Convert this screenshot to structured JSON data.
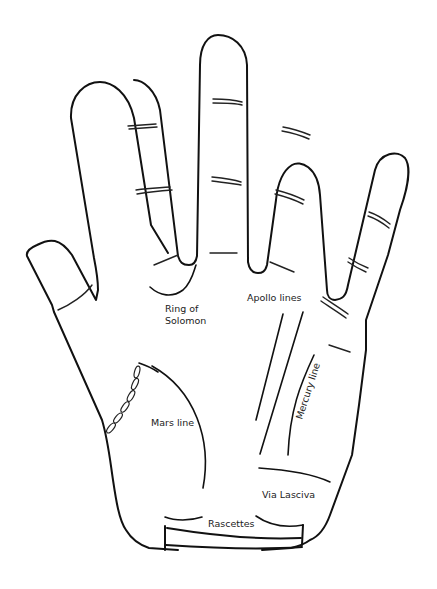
{
  "diagram": {
    "stroke_color": "#111111",
    "background_color": "#ffffff",
    "labels": {
      "ring_of_solomon_1": "Ring of",
      "ring_of_solomon_2": "Solomon",
      "apollo_lines": "Apollo lines",
      "mercury_line": "Mercury line",
      "mars_line": "Mars line",
      "via_lasciva": "Via Lasciva",
      "rascettes": "Rascettes"
    }
  }
}
